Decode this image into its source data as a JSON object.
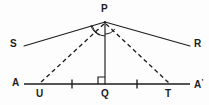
{
  "figure": {
    "background_color": "#fdfdfd",
    "ink_color": "#1d1d1d"
  },
  "labels": {
    "apex": "P",
    "ray_left": "S",
    "ray_right": "R",
    "base_left": "A",
    "base_right": "A",
    "base_right_prime": "'",
    "point_u": "U",
    "point_q": "Q",
    "point_t": "T"
  },
  "points": {
    "P": {
      "x": 105,
      "y": 22
    },
    "S_end": {
      "x": 24,
      "y": 46
    },
    "R_end": {
      "x": 190,
      "y": 46
    },
    "A_line_start": {
      "x": 24,
      "y": 84
    },
    "A_line_end": {
      "x": 190,
      "y": 84
    },
    "U": {
      "x": 40,
      "y": 84
    },
    "Q": {
      "x": 105,
      "y": 84
    },
    "T": {
      "x": 169,
      "y": 84
    }
  },
  "segments": [
    {
      "name": "ray-PS",
      "style": "solid",
      "from": "P",
      "to": "S_end"
    },
    {
      "name": "ray-PR",
      "style": "solid",
      "from": "P",
      "to": "R_end"
    },
    {
      "name": "altitude-PQ",
      "style": "solid",
      "from": "P",
      "to": "Q"
    },
    {
      "name": "segment-PU",
      "style": "dashed",
      "from": "P",
      "to": "U"
    },
    {
      "name": "segment-PT",
      "style": "dashed",
      "from": "P",
      "to": "T"
    },
    {
      "name": "baseline-AA",
      "style": "base",
      "from": "A_line_start",
      "to": "A_line_end"
    }
  ],
  "tick_marks": [
    {
      "name": "tick-left",
      "x": 72,
      "y": 84
    },
    {
      "name": "tick-right",
      "x": 137,
      "y": 84
    }
  ],
  "angle_arcs": [
    {
      "name": "angle-arc-left",
      "radius": 13
    },
    {
      "name": "angle-arc-right",
      "radius": 11
    }
  ],
  "right_angle": {
    "name": "right-angle-marker-at-Q",
    "size": 7
  }
}
